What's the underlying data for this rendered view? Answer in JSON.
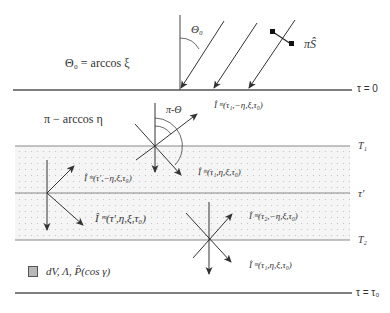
{
  "diagram": {
    "type": "radiative-transfer-layer-diagram",
    "colors": {
      "line": "#555555",
      "band_fill": "#f4f4f4",
      "band_dots": "#c8c8c8",
      "legend_box": "#b8b8b8"
    },
    "top_label": "Θ₀ = arccos ξ",
    "sun_angle_label": "Θ₀",
    "solar_flux_label": "πŜ",
    "scatter_angle_label": "π-Θ",
    "view_angle_label": "π − arccos η",
    "boundaries": {
      "top": "τ = 0",
      "t1": "T₁",
      "tprime": "τ′",
      "t2": "T₂",
      "bottom": "τ = τ₀"
    },
    "intensity_labels": {
      "i_tau1_minus": "Î ᵐ(τ₁,−η,ξ,τ₀)",
      "i_tau1_plus_upper": "Î ᵐ(τ₁,η,ξ,τ₀)",
      "i_tprime_minus": "Î ᵐ(τ′,−η,ξ,τ₀)",
      "i_tprime_plus": "Î ᵐ(τ′,η,ξ,τ₀)",
      "i_tau2_minus": "Î ᵐ(τ₂,−η,ξ,τ₀)",
      "i_tau1_plus_lower": "Î ᵐ(τ₁,η,ξ,τ₀)"
    },
    "legend": {
      "label": "dV, Λ, P̂(cos γ)"
    }
  }
}
